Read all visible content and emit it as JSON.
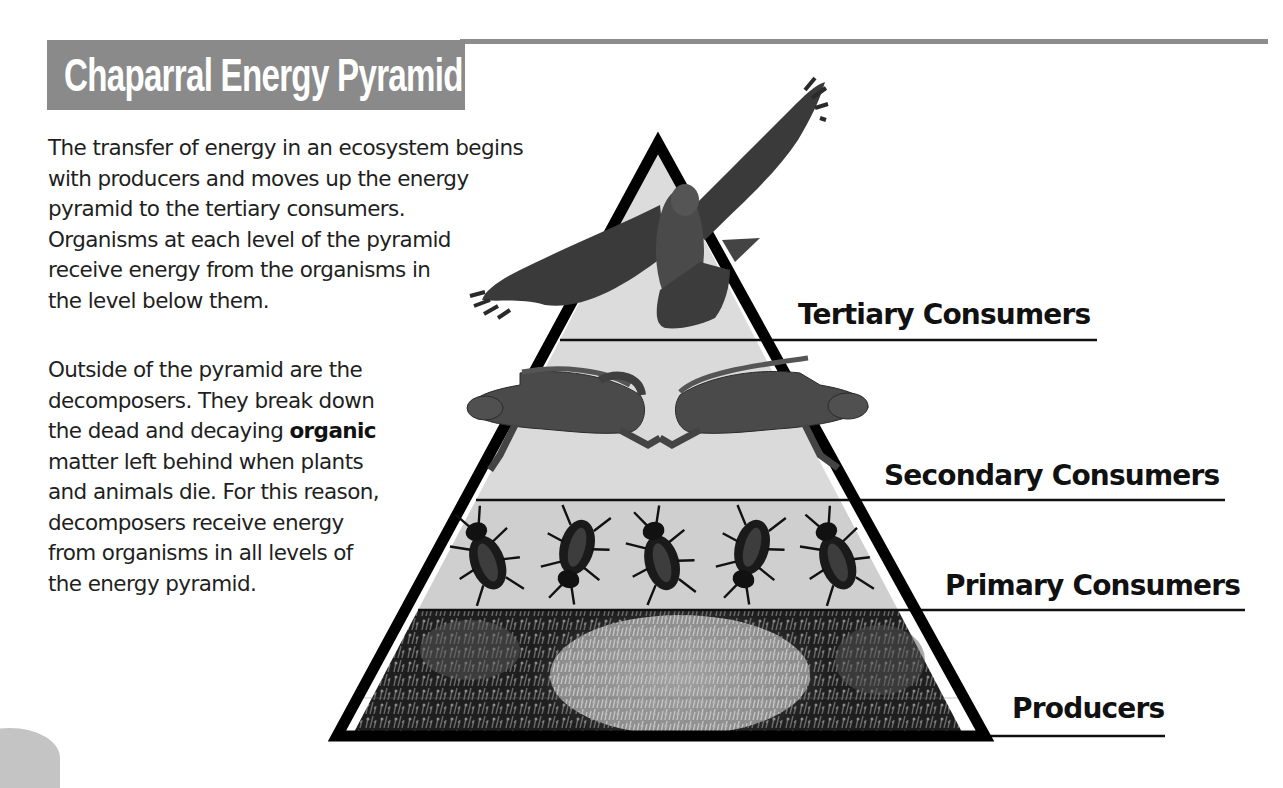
{
  "header": {
    "title": "Chaparral Energy Pyramid",
    "title_bg_color": "#8a8a8a",
    "title_text_color": "#ffffff",
    "rule_color": "#8d8d8d"
  },
  "body_text": {
    "paragraph_1": {
      "lines": [
        "The transfer of energy in an ecosystem begins",
        "with producers and moves up the energy",
        "pyramid to the tertiary consumers.",
        "Organisms at each level of the pyramid",
        "receive energy from the organisms in",
        "the level below them."
      ]
    },
    "paragraph_2": {
      "lines": [
        "Outside of the pyramid are the",
        "decomposers. They break down",
        "the dead and decaying ",
        "matter left behind when plants",
        "and animals die. For this reason,",
        "decomposers receive energy",
        "from organisms in all levels of",
        "the energy pyramid."
      ],
      "bold_term": "organic"
    }
  },
  "pyramid": {
    "levels": [
      {
        "id": "tertiary",
        "label": "Tertiary Consumers",
        "organism": "hawk",
        "count": 1
      },
      {
        "id": "secondary",
        "label": "Secondary Consumers",
        "organism": "lizard",
        "count": 2
      },
      {
        "id": "primary",
        "label": "Primary Consumers",
        "organism": "beetle",
        "count": 5
      },
      {
        "id": "producers",
        "label": "Producers",
        "organism": "chaparral shrubs",
        "count": 1
      }
    ],
    "fill_color": "#dcdcdc",
    "outline_color": "#000000"
  }
}
